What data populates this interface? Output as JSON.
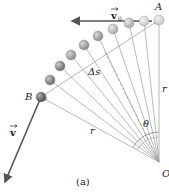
{
  "figure": {
    "caption": "(a)",
    "labels": {
      "point_a": "A",
      "point_b": "B",
      "origin": "O",
      "radius_right": "r",
      "radius_lower": "r",
      "arc_length": "Δs",
      "angle": "θ",
      "initial_velocity": "v",
      "initial_velocity_sub": "0",
      "final_velocity": "v"
    },
    "colors": {
      "line": "#9a9a9a",
      "arrow": "#555555",
      "ball_light": "#e4e4e4",
      "ball_dark": "#6a6a6a"
    }
  }
}
